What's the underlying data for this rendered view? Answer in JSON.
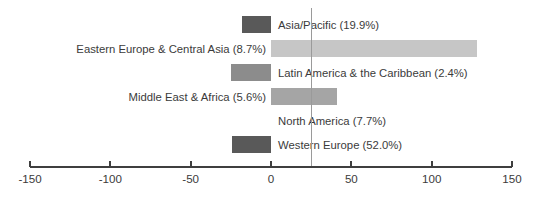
{
  "chart_data": {
    "type": "bar",
    "orientation": "horizontal",
    "title": "",
    "xlabel": "",
    "ylabel": "",
    "xlim": [
      -150,
      150
    ],
    "xticks": [
      -150,
      -100,
      -50,
      0,
      50,
      100,
      150
    ],
    "xtick_labels": [
      "-150",
      "-100",
      "-50",
      "0",
      "50",
      "100",
      "150"
    ],
    "grid": false,
    "legend": false,
    "reference_line": 25,
    "categories": [
      "Asia/Pacific (19.9%)",
      "Eastern Europe & Central Asia (8.7%)",
      "Latin America & the Caribbean (2.4%)",
      "Middle East & Africa (5.6%)",
      "North America (7.7%)",
      "Western Europe (52.0%)"
    ],
    "values": [
      -18,
      128,
      -25,
      41,
      0,
      -24
    ],
    "bars": [
      {
        "label": "Asia/Pacific (19.9%)",
        "share": "19.9%",
        "value": -18,
        "color": "#595959",
        "label_side": "right"
      },
      {
        "label": "Eastern Europe & Central Asia (8.7%)",
        "share": "8.7%",
        "value": 128,
        "color": "#c6c6c6",
        "label_side": "left"
      },
      {
        "label": "Latin America & the Caribbean (2.4%)",
        "share": "2.4%",
        "value": -25,
        "color": "#8c8c8c",
        "label_side": "right"
      },
      {
        "label": "Middle East & Africa (5.6%)",
        "share": "5.6%",
        "value": 41,
        "color": "#a5a5a5",
        "label_side": "left"
      },
      {
        "label": "North America (7.7%)",
        "share": "7.7%",
        "value": 0,
        "color": "#8c8c8c",
        "label_side": "right"
      },
      {
        "label": "Western Europe (52.0%)",
        "share": "52.0%",
        "value": -24,
        "color": "#595959",
        "label_side": "right"
      }
    ]
  },
  "colors": {
    "axis": "#3f3f3f",
    "text": "#3b3b3b",
    "reference_line": "#9a9a9a",
    "background": "#ffffff"
  }
}
